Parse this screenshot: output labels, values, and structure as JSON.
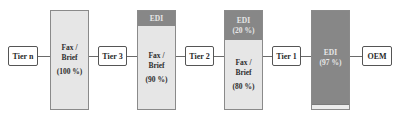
{
  "diagram": {
    "type": "supply-chain-communication-flow",
    "nodes": [
      {
        "id": "tier-n",
        "label": "Tier n"
      },
      {
        "id": "tier-3",
        "label": "Tier 3"
      },
      {
        "id": "tier-2",
        "label": "Tier 2"
      },
      {
        "id": "tier-1",
        "label": "Tier 1"
      },
      {
        "id": "oem",
        "label": "OEM"
      }
    ],
    "columns": [
      {
        "between": [
          "Tier n",
          "Tier 3"
        ],
        "segments": [
          {
            "kind": "fax",
            "label_line1": "Fax /",
            "label_line2": "Brief",
            "percent": "(100 %)"
          }
        ]
      },
      {
        "between": [
          "Tier 3",
          "Tier 2"
        ],
        "segments": [
          {
            "kind": "edi",
            "label": "EDI",
            "percent": ""
          },
          {
            "kind": "fax",
            "label_line1": "Fax /",
            "label_line2": "Brief",
            "percent": "(90 %)"
          }
        ]
      },
      {
        "between": [
          "Tier 2",
          "Tier 1"
        ],
        "segments": [
          {
            "kind": "edi",
            "label": "EDI",
            "percent": "(20 %)"
          },
          {
            "kind": "fax",
            "label_line1": "Fax /",
            "label_line2": "Brief",
            "percent": "(80 %)"
          }
        ]
      },
      {
        "between": [
          "Tier 1",
          "OEM"
        ],
        "segments": [
          {
            "kind": "edi",
            "label": "EDI",
            "percent": "(97 %)"
          },
          {
            "kind": "fax",
            "label": "",
            "percent": ""
          }
        ]
      }
    ],
    "colors": {
      "edi_fill": "#878787",
      "fax_fill": "#e6e6e6",
      "border": "#555555"
    }
  }
}
